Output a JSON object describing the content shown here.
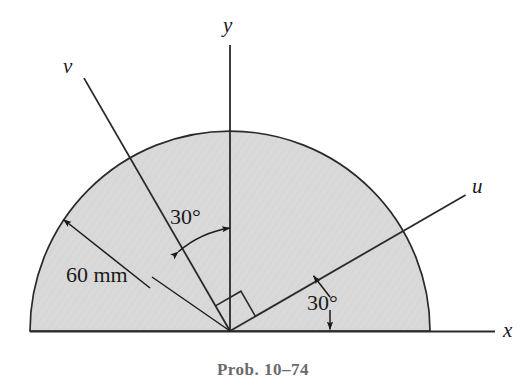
{
  "figure": {
    "caption": "Prob. 10–74",
    "shape": "semicircle",
    "fill_color": "#d9d9d9",
    "stroke_color": "#2a2a2a",
    "caption_color": "#6b6b6b",
    "origin": {
      "x": 230,
      "y": 331
    },
    "radius_px": 200,
    "axes": [
      {
        "id": "x",
        "label": "x",
        "label_x": 503,
        "label_y": 323,
        "angle_deg": 0,
        "length_px": 265
      },
      {
        "id": "y",
        "label": "y",
        "label_x": 223,
        "label_y": 14,
        "angle_deg": 90,
        "length_px": 286
      },
      {
        "id": "u",
        "label": "u",
        "label_x": 472,
        "label_y": 175,
        "angle_deg": 30,
        "length_px": 272
      },
      {
        "id": "v",
        "label": "v",
        "label_x": 64,
        "label_y": 55,
        "angle_deg": 120,
        "length_px": 292
      }
    ],
    "dimensions": [
      {
        "id": "radius",
        "text": "60 mm",
        "value": 60,
        "unit": "mm",
        "label_x": 68,
        "label_y": 263
      }
    ],
    "angles": [
      {
        "id": "angle-v-y",
        "text": "30°",
        "value": 30,
        "unit": "deg",
        "from": "v",
        "to": "y",
        "label_x": 172,
        "label_y": 204
      },
      {
        "id": "angle-u-x",
        "text": "30°",
        "value": 30,
        "unit": "deg",
        "from": "u",
        "to": "x",
        "label_x": 307,
        "label_y": 290
      }
    ],
    "marks": [
      {
        "id": "right-angle-u-v",
        "text": "",
        "between": [
          "v",
          "u"
        ],
        "value": 90,
        "unit": "deg"
      }
    ]
  }
}
